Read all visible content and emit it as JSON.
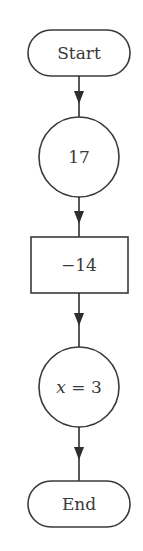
{
  "diagram": {
    "type": "flowchart",
    "direction": "top-to-bottom",
    "nodes": [
      {
        "id": "start",
        "shape": "terminal",
        "label": "Start"
      },
      {
        "id": "n1",
        "shape": "circle",
        "label": "17"
      },
      {
        "id": "n2",
        "shape": "rectangle",
        "label": "−14"
      },
      {
        "id": "n3",
        "shape": "circle",
        "label_var": "x",
        "label_rest": " = 3",
        "label": "x = 3"
      },
      {
        "id": "end",
        "shape": "terminal",
        "label": "End"
      }
    ],
    "edges": [
      {
        "from": "start",
        "to": "n1"
      },
      {
        "from": "n1",
        "to": "n2"
      },
      {
        "from": "n2",
        "to": "n3"
      },
      {
        "from": "n3",
        "to": "end"
      }
    ],
    "colors": {
      "stroke": "#3a3a3a",
      "fill": "#ffffff",
      "text": "#3a3a3a"
    }
  }
}
